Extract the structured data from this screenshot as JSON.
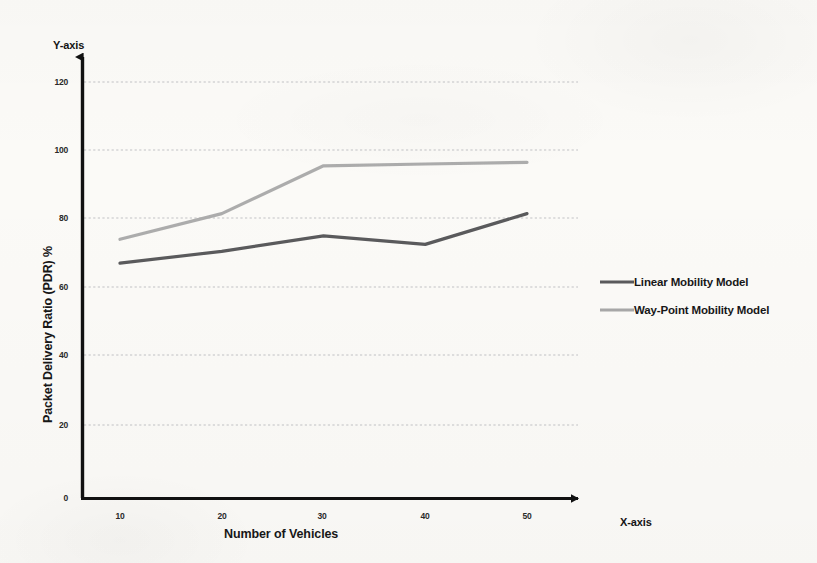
{
  "chart_data": {
    "type": "line",
    "title": "",
    "subtitle": "",
    "xlabel": "Number of Vehicles",
    "ylabel": "Packet Delivery Ratio (PDR) %",
    "x_axis_name": "X-axis",
    "y_axis_name": "Y-axis",
    "categories": [
      10,
      20,
      30,
      40,
      50
    ],
    "x_tick_labels": [
      "10",
      "20",
      "30",
      "40",
      "50"
    ],
    "y_tick_labels": [
      "0",
      "20",
      "40",
      "60",
      "80",
      "100",
      "120"
    ],
    "y_ticks": [
      0,
      20,
      40,
      60,
      80,
      100,
      120
    ],
    "xlim": [
      5,
      55
    ],
    "ylim": [
      0,
      120
    ],
    "grid": "horizontal-dotted",
    "legend_position": "right",
    "series": [
      {
        "name": "Linear Mobility Model",
        "color": "#5a5a5c",
        "values": [
          68.5,
          72.0,
          76.5,
          74.0,
          83.0
        ]
      },
      {
        "name": "Way-Point Mobility Model",
        "color": "#a8a8a8",
        "values": [
          75.5,
          83.0,
          97.0,
          97.5,
          98.0
        ]
      }
    ]
  },
  "axes": {
    "x_axis_name": "X-axis",
    "y_axis_name": "Y-axis",
    "x_title": "Number of Vehicles",
    "y_title": "Packet Delivery Ratio (PDR) %",
    "x_ticks": [
      "10",
      "20",
      "30",
      "40",
      "50"
    ],
    "y_ticks": [
      "120",
      "100",
      "80",
      "60",
      "40",
      "20",
      "0"
    ]
  },
  "legend": {
    "items": [
      {
        "label": "Linear Mobility Model",
        "color": "#5a5a5c"
      },
      {
        "label": "Way-Point Mobility Model",
        "color": "#a8a8a8"
      }
    ]
  },
  "colors": {
    "background": "#fbfaf7",
    "axis": "#111111",
    "gridline": "#b9b9bd",
    "series_linear": "#5a5a5c",
    "series_waypoint": "#a8a8a8"
  }
}
